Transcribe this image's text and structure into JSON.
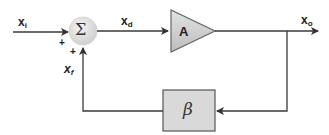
{
  "diagram": {
    "type": "negative-feedback-block-diagram",
    "colors": {
      "line": "#3a3a3a",
      "block_fill": "#d9d9d9",
      "block_stroke": "#555555",
      "summer_fill": "#dcdcdc",
      "text": "#222222"
    },
    "signals": {
      "input": {
        "var": "x",
        "sub": "i"
      },
      "difference": {
        "var": "x",
        "sub": "d"
      },
      "output": {
        "var": "x",
        "sub": "o"
      },
      "feedback": {
        "var": "x",
        "sub": "f"
      }
    },
    "summer": {
      "symbol": "Σ",
      "signs": [
        "+",
        "+"
      ]
    },
    "amplifier": {
      "label": "A"
    },
    "feedback_block": {
      "label": "β"
    }
  }
}
